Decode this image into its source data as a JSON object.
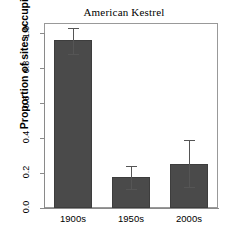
{
  "chart_data": {
    "type": "bar",
    "title": "American Kestrel",
    "xlabel": "",
    "ylabel": "Proportion of sites occupied",
    "categories": [
      "1900s",
      "1950s",
      "2000s"
    ],
    "values": [
      0.96,
      0.18,
      0.25
    ],
    "error_low": [
      0.88,
      0.11,
      0.12
    ],
    "error_high": [
      1.03,
      0.24,
      0.39
    ],
    "ylim": [
      0.0,
      1.0
    ],
    "ytick_labels": [
      "0.0",
      "0.2",
      "0.4",
      "0.6",
      "0.8",
      "1.0"
    ],
    "ytick_values": [
      0.0,
      0.2,
      0.4,
      0.6,
      0.8,
      1.0
    ],
    "grid": false,
    "legend": false,
    "bar_color": "#4a4a4a",
    "error_color": "#555555",
    "axis_color": "#8a8a8a",
    "frame_color": "#999999",
    "background": "#ffffff"
  }
}
